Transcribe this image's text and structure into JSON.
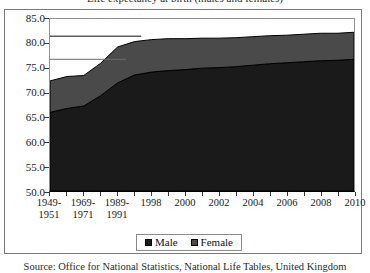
{
  "chart_data": {
    "type": "area",
    "stacked": true,
    "title": "Life expectancy at birth (males and females)",
    "subtitle": "",
    "caption": "Source: Office for National Statistics, National Life Tables, United Kingdom",
    "xlabel": "",
    "ylabel": "",
    "ylim": [
      50.0,
      85.0
    ],
    "ytick_step": 5.0,
    "grid": false,
    "legend_position": "bottom",
    "categories": [
      "1949-1951",
      "1959-1961",
      "1969-1971",
      "1979-1981",
      "1989-1991",
      "1996",
      "1998",
      "1999",
      "2000",
      "2001",
      "2002",
      "2003",
      "2004",
      "2005",
      "2006",
      "2007",
      "2008",
      "2009",
      "2010"
    ],
    "tick_labels": [
      "1949-\n1951",
      "",
      "1969-\n1971",
      "",
      "1989-\n1991",
      "",
      "1998",
      "",
      "2000",
      "",
      "2002",
      "",
      "2004",
      "",
      "2006",
      "",
      "2008",
      "",
      "2010"
    ],
    "ytick_labels": [
      "85.0",
      "80.0",
      "75.0",
      "70.0",
      "65.0",
      "60.0",
      "55.0",
      "50.0"
    ],
    "ytick_values": [
      85.0,
      80.0,
      75.0,
      70.0,
      65.0,
      60.0,
      55.0,
      50.0
    ],
    "series": [
      {
        "name": "Male",
        "color": "#1a1a1a",
        "values": [
          66.0,
          66.8,
          67.3,
          69.4,
          72.0,
          73.6,
          74.2,
          74.5,
          74.7,
          75.0,
          75.1,
          75.3,
          75.6,
          75.9,
          76.1,
          76.3,
          76.5,
          76.6,
          76.8
        ]
      },
      {
        "name": "Female",
        "color": "#4a4a4a",
        "values": [
          6.4,
          6.5,
          6.2,
          6.6,
          7.3,
          6.8,
          6.6,
          6.5,
          6.3,
          6.1,
          6.0,
          5.9,
          5.8,
          5.7,
          5.6,
          5.6,
          5.6,
          5.5,
          5.5
        ]
      }
    ],
    "series_totals": [
      72.4,
      73.3,
      73.5,
      76.0,
      79.3,
      80.4,
      80.8,
      81.0,
      81.0,
      81.1,
      81.1,
      81.2,
      81.4,
      81.6,
      81.7,
      81.9,
      82.1,
      82.1,
      82.3
    ],
    "reference_lines": [
      {
        "value": 81.5,
        "x_end_fraction": 0.3,
        "color": "#111111"
      },
      {
        "value": 76.8,
        "x_end_fraction": 0.25,
        "color": "#6b6b6b"
      }
    ],
    "legend": [
      {
        "label": "Male",
        "color": "#1a1a1a"
      },
      {
        "label": "Female",
        "color": "#4a4a4a"
      }
    ]
  },
  "colors": {
    "male": "#1a1a1a",
    "female": "#4a4a4a",
    "frame_border": "#7a7a7a",
    "plot_border": "#8f8f8f",
    "axis": "#000000",
    "text": "#1a1a1a"
  }
}
